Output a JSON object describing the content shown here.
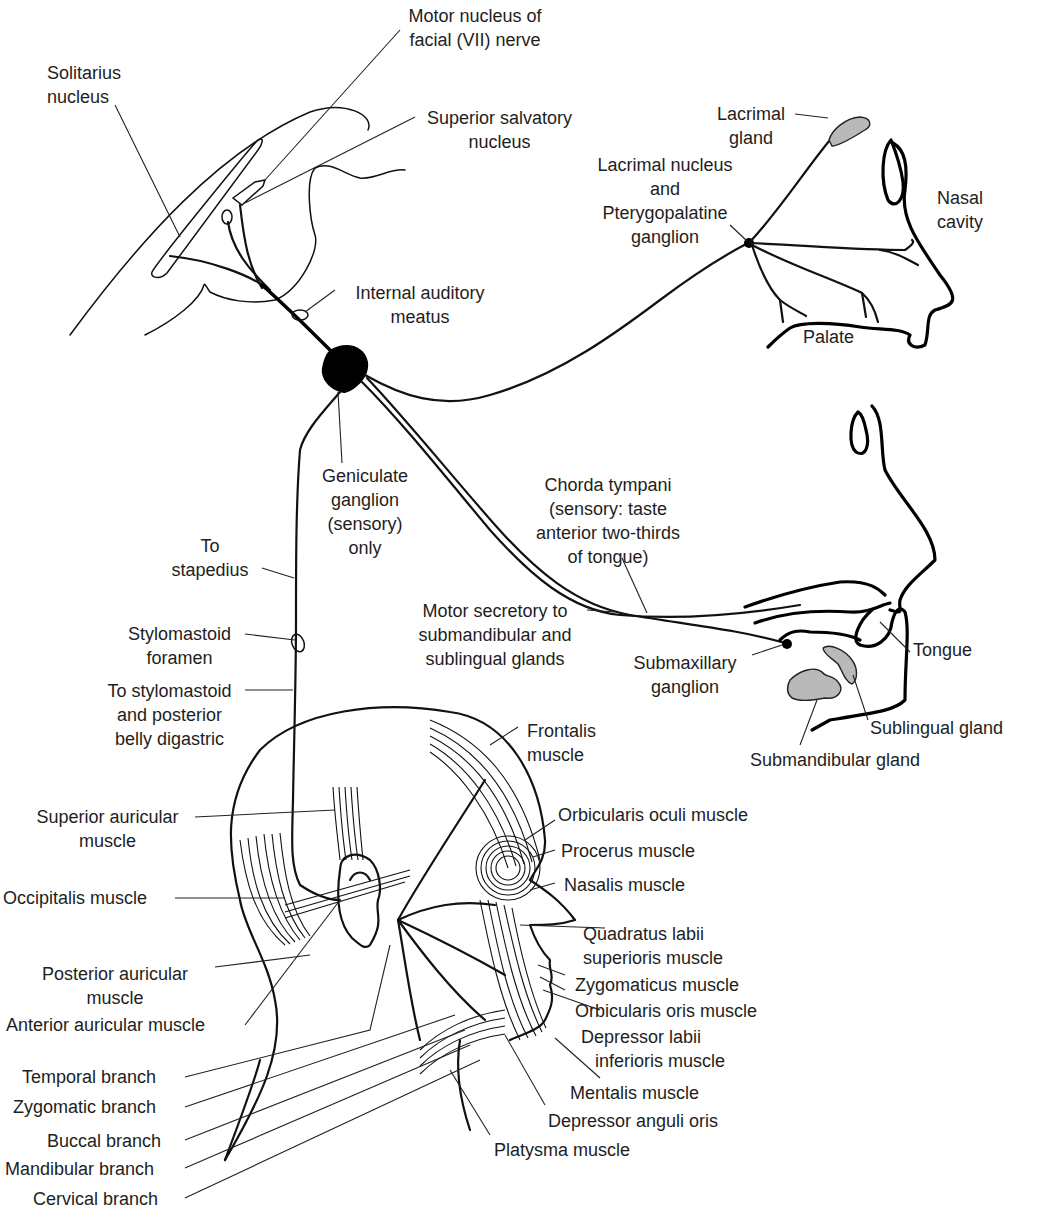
{
  "figure": {
    "colors": {
      "line": "#111111",
      "gland_fill": "#b9b9b9",
      "background": "#ffffff"
    }
  },
  "labels": {
    "motor_nucleus": [
      "Motor nucleus of",
      "facial (VII) nerve"
    ],
    "solitarius": [
      "Solitarius",
      "nucleus"
    ],
    "superior_salvatory": [
      "Superior salvatory",
      "nucleus"
    ],
    "lacrimal_gland": [
      "Lacrimal",
      "gland"
    ],
    "lacrimal_nucleus": [
      "Lacrimal nucleus",
      "and",
      "Pterygopalatine",
      "ganglion"
    ],
    "nasal_cavity": [
      "Nasal",
      "cavity"
    ],
    "internal_auditory": [
      "Internal auditory",
      "meatus"
    ],
    "palate": [
      "Palate"
    ],
    "geniculate": [
      "Geniculate",
      "ganglion",
      "(sensory)",
      "only"
    ],
    "chorda_tympani": [
      "Chorda tympani",
      "(sensory: taste",
      "anterior two-thirds",
      "of tongue)"
    ],
    "to_stapedius": [
      "To",
      "stapedius"
    ],
    "motor_secretory": [
      "Motor secretory to",
      "submandibular and",
      "sublingual glands"
    ],
    "tongue": [
      "Tongue"
    ],
    "stylomastoid_foramen": [
      "Stylomastoid",
      "foramen"
    ],
    "submaxillary": [
      "Submaxillary",
      "ganglion"
    ],
    "to_stylomastoid": [
      "To stylomastoid",
      "and posterior",
      "belly digastric"
    ],
    "sublingual_gland": [
      "Sublingual gland"
    ],
    "frontalis": [
      "Frontalis",
      "muscle"
    ],
    "submandibular_gland": [
      "Submandibular gland"
    ],
    "superior_auricular": [
      "Superior auricular",
      "muscle"
    ],
    "orbicularis_oculi": [
      "Orbicularis oculi muscle"
    ],
    "procerus": [
      "Procerus muscle"
    ],
    "occipitalis": [
      "Occipitalis muscle"
    ],
    "nasalis": [
      "Nasalis muscle"
    ],
    "quadratus": [
      "Quadratus labii",
      "superioris muscle"
    ],
    "posterior_auricular": [
      "Posterior auricular",
      "muscle"
    ],
    "zygomaticus": [
      "Zygomaticus muscle"
    ],
    "anterior_auricular": [
      "Anterior auricular muscle"
    ],
    "orbicularis_oris": [
      "Orbicularis oris muscle"
    ],
    "depressor_labii": [
      "Depressor labii",
      "inferioris muscle"
    ],
    "temporal_branch": [
      "Temporal branch"
    ],
    "mentalis": [
      "Mentalis muscle"
    ],
    "zygomatic_branch": [
      "Zygomatic branch"
    ],
    "depressor_anguli": [
      "Depressor anguli oris"
    ],
    "buccal_branch": [
      "Buccal branch"
    ],
    "platysma": [
      "Platysma muscle"
    ],
    "mandibular_branch": [
      "Mandibular branch"
    ],
    "cervical_branch": [
      "Cervical branch"
    ]
  }
}
